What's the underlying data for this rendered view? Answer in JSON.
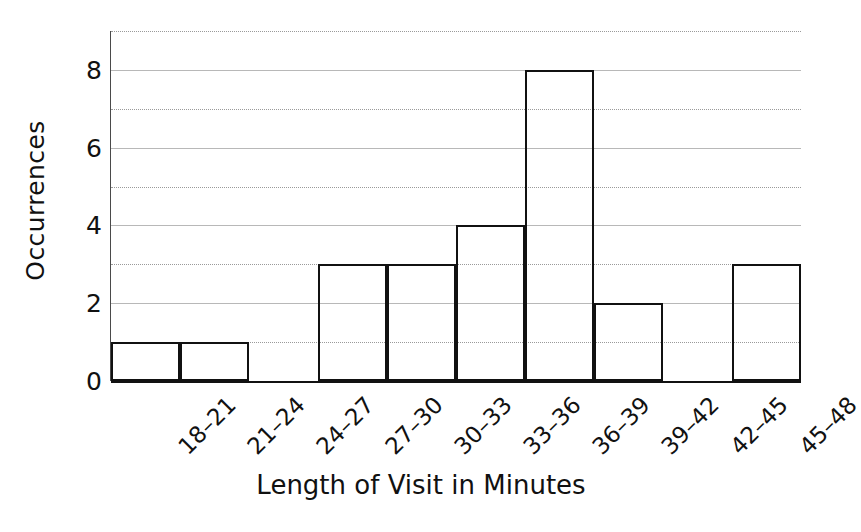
{
  "chart_data": {
    "type": "bar",
    "title": "",
    "subtitle": "",
    "xlabel": "Length of Visit in Minutes",
    "ylabel": "Occurrences",
    "categories": [
      "18–21",
      "21–24",
      "24–27",
      "27–30",
      "30–33",
      "33–36",
      "36–39",
      "39–42",
      "42–45",
      "45–48"
    ],
    "values": [
      1,
      1,
      0,
      3,
      3,
      4,
      8,
      2,
      0,
      3
    ],
    "ylim": [
      0,
      9
    ],
    "xlim_categories": 10,
    "y_tick_labels": [
      "0",
      "2",
      "4",
      "6",
      "8"
    ],
    "y_tick_values": [
      0,
      2,
      4,
      6,
      8
    ],
    "y_gridline_values": [
      1,
      2,
      3,
      4,
      5,
      6,
      7,
      8,
      9
    ],
    "grid": true,
    "grid_axis": "y",
    "legend": false,
    "legend_position": "none",
    "bar_fill": "#ffffff",
    "bar_edge_color": "#111111",
    "background_color": "#ffffff",
    "gridline_color": "#9a9a9a",
    "axis_color": "#111111",
    "x_tick_rotation": -45,
    "bar_gap": 0,
    "annotations": []
  }
}
